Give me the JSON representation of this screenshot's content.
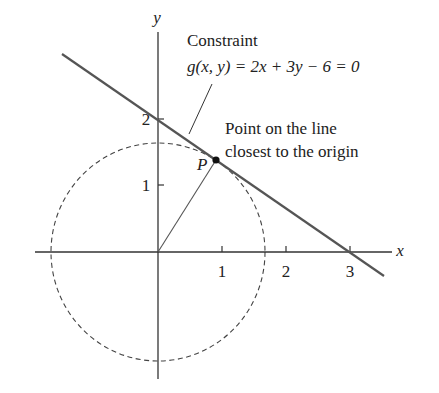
{
  "figure": {
    "axes": {
      "x_label": "x",
      "y_label": "y",
      "x_ticks": [
        {
          "value": 1,
          "label": "1"
        },
        {
          "value": 2,
          "label": "2"
        },
        {
          "value": 3,
          "label": "3"
        }
      ],
      "y_ticks": [
        {
          "value": 1,
          "label": "1"
        },
        {
          "value": 2,
          "label": "2"
        }
      ]
    },
    "constraint": {
      "title": "Constraint",
      "equation": "g(x, y) = 2x + 3y − 6 = 0"
    },
    "point": {
      "label": "P",
      "annotation_line1": "Point on the line",
      "annotation_line2": "closest to the origin"
    },
    "colors": {
      "line": "#555555",
      "axis": "#333333",
      "circle": "#444444",
      "text": "#222222"
    }
  }
}
